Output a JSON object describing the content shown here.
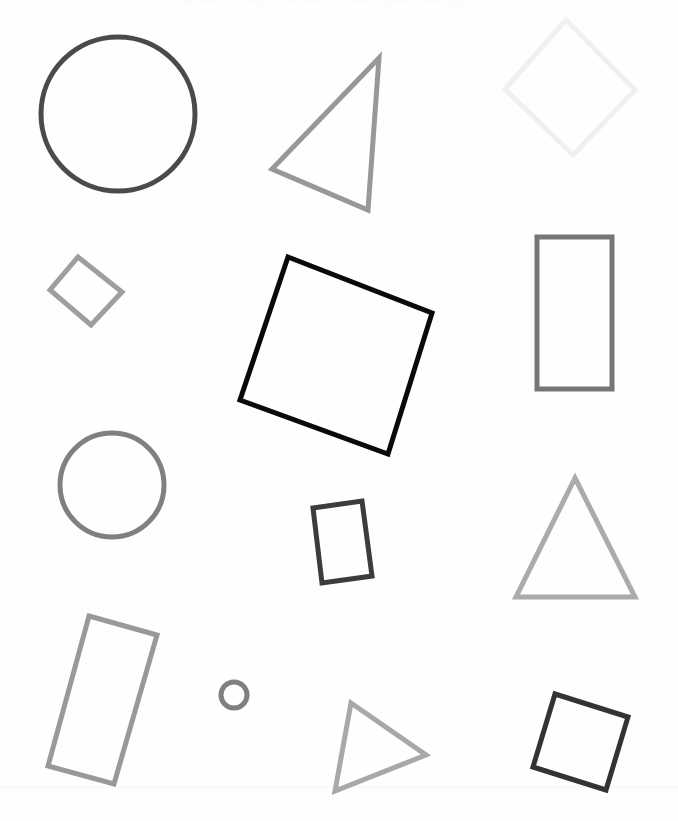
{
  "canvas": {
    "width": 678,
    "height": 821,
    "background_color": "#fefefe",
    "clipped_caption": "random shapes scattered on a plain background",
    "caption_color": "#fbfbfb"
  },
  "guides": [
    {
      "name": "faint-baseline",
      "type": "line",
      "x1": 0,
      "y1": 787,
      "x2": 678,
      "y2": 787,
      "color": "#f4f4f4",
      "stroke_width": 1
    }
  ],
  "shapes": [
    {
      "id": "circle-large-dark",
      "label": "Large dark circle",
      "type": "circle",
      "cx": 118,
      "cy": 114,
      "r": 77,
      "color": "#4a4a4a",
      "stroke_width": 5,
      "fill": "none"
    },
    {
      "id": "triangle-top-middle",
      "label": "Tilted gray triangle",
      "type": "polygon",
      "points": "379,58 272,169 368,210",
      "color": "#989898",
      "stroke_width": 5,
      "fill": "none"
    },
    {
      "id": "diamond-top-right",
      "label": "Pale diamond",
      "type": "polygon",
      "points": "566,20 635,90 573,155 505,89",
      "color": "#f0f0f0",
      "stroke_width": 5,
      "fill": "none"
    },
    {
      "id": "diamond-small-left",
      "label": "Small rotated square",
      "type": "polygon",
      "points": "78,257 122,292 91,325 50,290",
      "color": "#9e9e9e",
      "stroke_width": 5,
      "fill": "none"
    },
    {
      "id": "square-large-black",
      "label": "Large black rotated square",
      "type": "polygon",
      "points": "288,257 432,313 388,454 240,400",
      "color": "#0a0a0a",
      "stroke_width": 5,
      "fill": "none"
    },
    {
      "id": "rectangle-right-tall",
      "label": "Tall gray rectangle",
      "type": "rect",
      "x": 537,
      "y": 237,
      "width": 75,
      "height": 152,
      "color": "#767676",
      "stroke_width": 5,
      "fill": "none"
    },
    {
      "id": "circle-medium-gray",
      "label": "Medium gray circle",
      "type": "circle",
      "cx": 112,
      "cy": 485,
      "r": 52,
      "color": "#808080",
      "stroke_width": 5,
      "fill": "none"
    },
    {
      "id": "rectangle-small-dark",
      "label": "Small dark tilted rectangle",
      "type": "polygon",
      "points": "313,508 362,501 372,576 322,583",
      "color": "#3c3c3c",
      "stroke_width": 5,
      "fill": "none"
    },
    {
      "id": "triangle-right-upright",
      "label": "Upright light gray triangle",
      "type": "polygon",
      "points": "575,478 635,597 516,597",
      "color": "#ababab",
      "stroke_width": 5,
      "fill": "none"
    },
    {
      "id": "rectangle-bottom-left",
      "label": "Tilted tall rectangle",
      "type": "polygon",
      "points": "89,616 157,635 114,784 48,766",
      "color": "#999999",
      "stroke_width": 5,
      "fill": "none"
    },
    {
      "id": "circle-tiny",
      "label": "Tiny circle",
      "type": "circle",
      "cx": 234,
      "cy": 695,
      "r": 13,
      "color": "#808080",
      "stroke_width": 5,
      "fill": "none"
    },
    {
      "id": "triangle-bottom-middle",
      "label": "Bottom tilted triangle",
      "type": "polygon",
      "points": "351,703 426,755 335,791",
      "color": "#a8a8a8",
      "stroke_width": 5,
      "fill": "none"
    },
    {
      "id": "square-bottom-right",
      "label": "Bottom right dark square",
      "type": "polygon",
      "points": "555,694 628,717 606,790 533,767",
      "color": "#333333",
      "stroke_width": 5,
      "fill": "none"
    }
  ]
}
